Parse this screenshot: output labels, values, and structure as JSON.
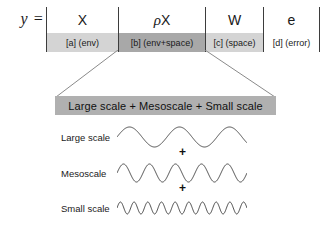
{
  "equation": {
    "lhs": "y ="
  },
  "table": {
    "columns": [
      {
        "term": "X",
        "term_prefix": "",
        "tag": "[a] (env)",
        "shade": "light"
      },
      {
        "term": "X",
        "term_prefix": "ρ",
        "tag": "[b] (env+space)",
        "shade": "dark"
      },
      {
        "term": "W",
        "term_prefix": "",
        "tag": "[c] (space)",
        "shade": "light"
      },
      {
        "term": "e",
        "term_prefix": "",
        "tag": "[d] (error)",
        "shade": "white"
      }
    ]
  },
  "decomposition": {
    "headline": "Large scale + Mesoscale + Small scale",
    "operator": "+",
    "rows": [
      {
        "label": "Large scale",
        "cycles": 2.6,
        "amplitude": 10
      },
      {
        "label": "Mesoscale",
        "cycles": 5.0,
        "amplitude": 9
      },
      {
        "label": "Small scale",
        "cycles": 9.5,
        "amplitude": 6
      }
    ]
  },
  "colors": {
    "shade_light": "#d4d4d4",
    "shade_dark": "#a8a8a8",
    "bar_grey": "#b0b0b0",
    "line": "#3d3d3d",
    "text": "#1a1a1a"
  }
}
